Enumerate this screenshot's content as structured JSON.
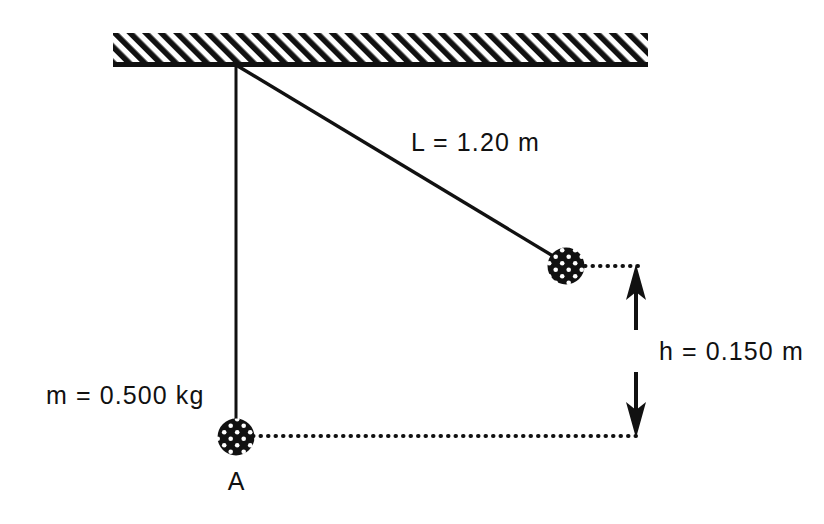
{
  "figure": {
    "type": "physics-diagram"
  },
  "labels": {
    "string_length": "L = 1.20 m",
    "mass": "m = 0.500 kg",
    "height": "h = 0.150 m",
    "lowest_point": "A"
  },
  "quantities": [
    {
      "symbol": "L",
      "value": "1.20",
      "unit": "m",
      "name": "string length"
    },
    {
      "symbol": "m",
      "value": "0.500",
      "unit": "kg",
      "name": "bob mass"
    },
    {
      "symbol": "h",
      "value": "0.150",
      "unit": "m",
      "name": "vertical rise"
    }
  ],
  "colors": {
    "ink": "#111111",
    "background": "#ffffff",
    "bob_fill": "#111111",
    "bob_speckle": "#ffffff"
  },
  "geometry": {
    "ceiling": {
      "x": 113,
      "y": 33,
      "width": 535,
      "height": 32
    },
    "pivot": {
      "x": 236,
      "y": 65
    },
    "bob_rest": {
      "x": 236,
      "y": 437,
      "r": 18
    },
    "bob_raised": {
      "x": 566,
      "y": 266,
      "r": 18
    },
    "measure_axis_x": 636,
    "height_top_y": 266,
    "height_bottom_y": 436
  }
}
